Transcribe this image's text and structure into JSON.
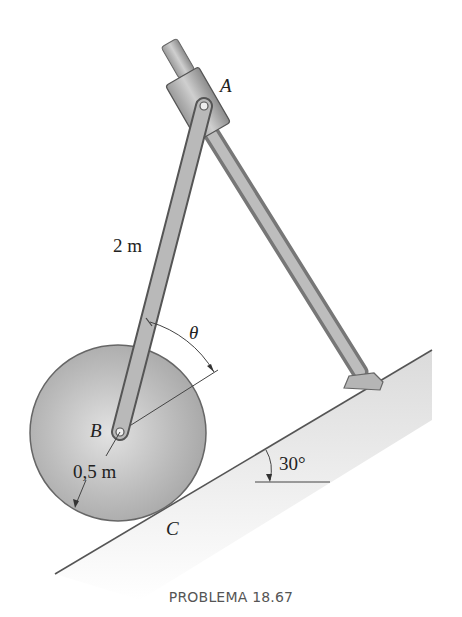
{
  "figure": {
    "caption": "PROBLEMA 18.67",
    "labels": {
      "point_a": "A",
      "point_b": "B",
      "point_c": "C",
      "rod_length": "2 m",
      "radius": "0,5 m",
      "angle_theta": "θ",
      "incline_angle": "30°"
    },
    "colors": {
      "disk": "#b8b8b8",
      "rod": "#a9a9a9",
      "outline": "#555555",
      "ground": "#d0d0d0"
    }
  }
}
